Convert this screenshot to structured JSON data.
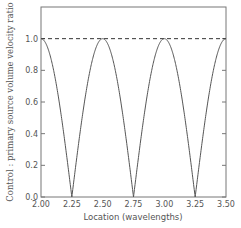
{
  "chart_data": {
    "type": "line",
    "title": "",
    "xlabel": "Location (wavelengths)",
    "ylabel": "Control : primary source volume velocity ratio",
    "xlim": [
      2.0,
      3.5
    ],
    "ylim": [
      0.0,
      1.2
    ],
    "xticks": [
      "2.00",
      "2.25",
      "2.50",
      "2.75",
      "3.00",
      "3.25",
      "3.50"
    ],
    "yticks": [
      "0.0",
      "0.2",
      "0.4",
      "0.6",
      "0.8",
      "1.0"
    ],
    "grid": false,
    "legend": null,
    "series": [
      {
        "name": "ratio |cos(2πx)|",
        "style": "solid",
        "x": [
          2.0,
          2.125,
          2.25,
          2.375,
          2.5,
          2.625,
          2.75,
          2.875,
          3.0,
          3.125,
          3.25,
          3.375,
          3.5
        ],
        "values": [
          1.0,
          0.707,
          0.0,
          0.707,
          1.0,
          0.707,
          0.0,
          0.707,
          1.0,
          0.707,
          0.0,
          0.707,
          1.0
        ]
      },
      {
        "name": "reference 1.0",
        "style": "dashed",
        "x": [
          2.0,
          3.5
        ],
        "values": [
          1.0,
          1.0
        ]
      }
    ]
  }
}
